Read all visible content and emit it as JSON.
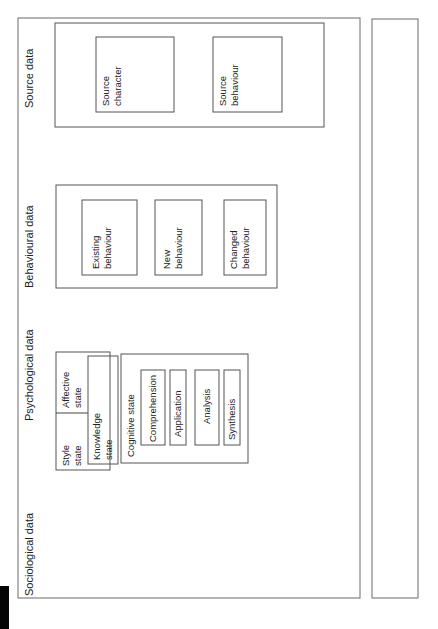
{
  "sections": {
    "sociological": "Sociological data",
    "psychological": "Psychological data",
    "behavioural": "Behavioural data",
    "source": "Source data"
  },
  "sociological": {
    "norms": "Norms",
    "roles": "Roles",
    "tasks": "Tasks"
  },
  "psychological": {
    "style_state": [
      "Style",
      "state"
    ],
    "affective_state": [
      "Affective",
      "state"
    ],
    "knowledge_state": [
      "Knowledge",
      "state"
    ],
    "cognitive_state": {
      "title": "Cognitive state",
      "items": [
        "Comprehension",
        "Application",
        "Analysis",
        "Synthesis"
      ]
    },
    "metacognitive_state": {
      "title": "Metacognitive state",
      "items": [
        "Evaluation",
        "Reflection"
      ]
    }
  },
  "behavioural": {
    "existing": [
      "Existing",
      "behaviour"
    ],
    "new": [
      "New",
      "behaviour"
    ],
    "changed": [
      "Changed",
      "behaviour"
    ]
  },
  "source": {
    "character": [
      "Source",
      "character"
    ],
    "behaviour": [
      "Source",
      "behaviour"
    ]
  },
  "arrows": {
    "a1": "1",
    "a2": "2",
    "a3": "3",
    "a4": "4",
    "a4_label": "Iterative interaction",
    "a5": "5"
  },
  "key": {
    "title": "Key:",
    "k1": "1 = associated with",
    "k2": "2 = associated with",
    "k3": "3 = interaction with",
    "k4": "4 = has impact on",
    "k5": "5 = may resolve situation and help complete task(s)"
  }
}
